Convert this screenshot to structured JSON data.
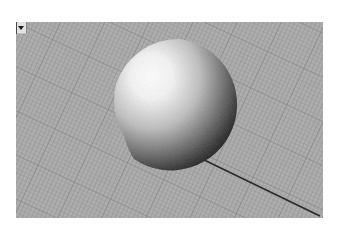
{
  "viewport": {
    "name": "Perspective",
    "label": "",
    "menu_icon": "chevron-down-icon",
    "background_color": "#a9a9a9",
    "grid_color": "#8c8c8c",
    "axis_line_color": "#2a2a2a"
  },
  "scene": {
    "objects": [
      {
        "type": "sphere",
        "shading": "rendered",
        "center_px": [
          180,
          105
        ],
        "radius_px": 66,
        "highlight_color": "#ffffff",
        "shadow_color": "#1c1c1c"
      }
    ],
    "axis_line": {
      "from_px": [
        210,
        165
      ],
      "to_px": [
        320,
        215
      ]
    }
  }
}
